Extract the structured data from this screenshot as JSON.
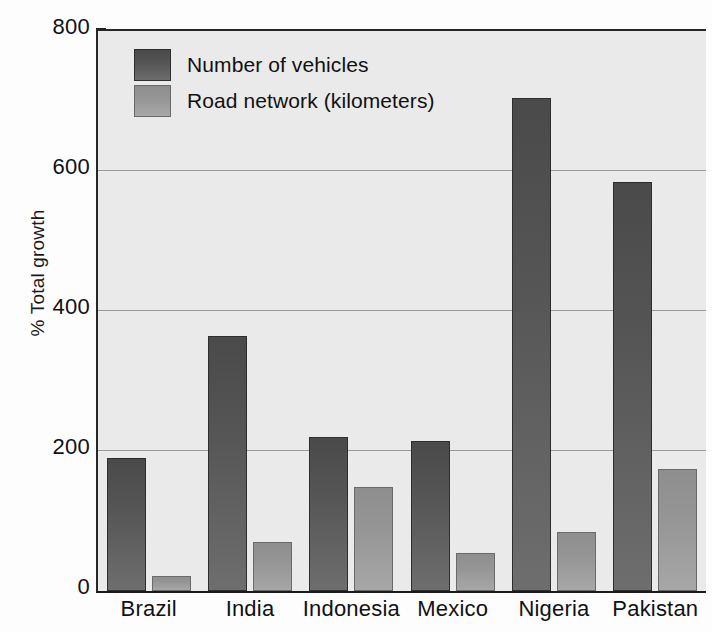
{
  "chart_data": {
    "type": "bar",
    "title": "",
    "xlabel": "",
    "ylabel": "% Total growth",
    "ylim": [
      0,
      800
    ],
    "yticks": [
      0,
      200,
      400,
      600,
      800
    ],
    "ytick_labels": [
      "0",
      "200",
      "400",
      "600",
      "800"
    ],
    "grid": true,
    "legend_position": "top-left",
    "categories": [
      "Brazil",
      "India",
      "Indonesia",
      "Mexico",
      "Nigeria",
      "Pakistan"
    ],
    "series": [
      {
        "name": "Number of vehicles",
        "color": "#565656",
        "values": [
          190,
          365,
          220,
          215,
          705,
          585
        ]
      },
      {
        "name": "Road network (kilometers)",
        "color": "#969696",
        "values": [
          22,
          70,
          148,
          55,
          85,
          175
        ]
      }
    ]
  },
  "axes": {
    "y_title": "% Total growth",
    "y_ticks": [
      "800",
      "600",
      "400",
      "200",
      "0"
    ],
    "x_ticks": [
      "Brazil",
      "India",
      "Indonesia",
      "Mexico",
      "Nigeria",
      "Pakistan"
    ]
  },
  "legend": {
    "items": [
      {
        "label": "Number of vehicles"
      },
      {
        "label": "Road network (kilometers)"
      }
    ]
  }
}
